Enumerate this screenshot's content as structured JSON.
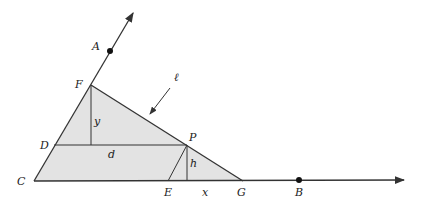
{
  "diagram": {
    "type": "geometry",
    "fill_color": "#e3e3e3",
    "stroke_color": "#333333",
    "points": {
      "A": {
        "label": "A",
        "x": 110,
        "y": 51
      },
      "B": {
        "label": "B",
        "x": 299,
        "y": 180
      },
      "C": {
        "label": "C",
        "x": 34,
        "y": 181
      },
      "D": {
        "label": "D",
        "x": 54,
        "y": 145
      },
      "E": {
        "label": "E",
        "x": 168,
        "y": 181
      },
      "F": {
        "label": "F",
        "x": 91,
        "y": 85
      },
      "G": {
        "label": "G",
        "x": 243,
        "y": 181
      },
      "P": {
        "label": "P",
        "x": 187,
        "y": 144
      }
    },
    "segment_labels": {
      "y": "y",
      "d": "d",
      "h": "h",
      "x": "x"
    },
    "line_label": "ℓ",
    "rays": [
      {
        "from": "C",
        "through": "A",
        "name": "ray-CA"
      },
      {
        "from": "C",
        "through": "B",
        "name": "ray-CB"
      }
    ],
    "shaded_triangle": [
      "C",
      "F",
      "G"
    ]
  }
}
